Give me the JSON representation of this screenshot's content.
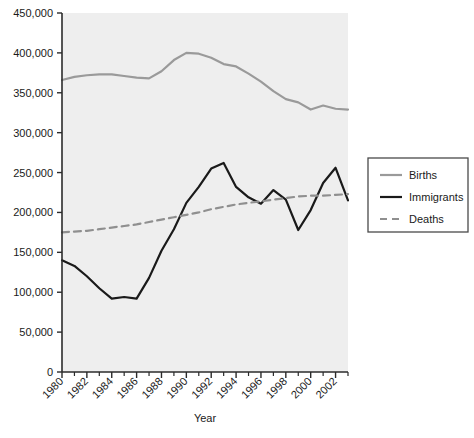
{
  "chart_data": {
    "type": "line",
    "title": "",
    "xlabel": "Year",
    "ylabel": "",
    "xlim": [
      1980,
      2003
    ],
    "ylim": [
      0,
      450000
    ],
    "grid": false,
    "legend_position": "right",
    "plot_background": "#eeeeee",
    "x": [
      1980,
      1981,
      1982,
      1983,
      1984,
      1985,
      1986,
      1987,
      1988,
      1989,
      1990,
      1991,
      1992,
      1993,
      1994,
      1995,
      1996,
      1997,
      1998,
      1999,
      2000,
      2001,
      2002,
      2003
    ],
    "xticks": [
      1980,
      1982,
      1984,
      1986,
      1988,
      1990,
      1992,
      1994,
      1996,
      1998,
      2000,
      2002
    ],
    "xtick_labels": [
      "1980",
      "1982",
      "1984",
      "1986",
      "1988",
      "1990",
      "1992",
      "1994",
      "1996",
      "1998",
      "2000",
      "2002"
    ],
    "xminorticks": [
      1981,
      1983,
      1985,
      1987,
      1989,
      1991,
      1993,
      1995,
      1997,
      1999,
      2001,
      2003
    ],
    "yticks": [
      0,
      50000,
      100000,
      150000,
      200000,
      250000,
      300000,
      350000,
      400000,
      450000
    ],
    "ytick_labels": [
      "0",
      "50,000",
      "100,000",
      "150,000",
      "200,000",
      "250,000",
      "300,000",
      "350,000",
      "400,000",
      "450,000"
    ],
    "series": [
      {
        "name": "Births",
        "color": "#9a9a9a",
        "style": "solid",
        "width": 2.2,
        "values": [
          366000,
          370000,
          372000,
          373000,
          373000,
          371000,
          369000,
          368000,
          377000,
          391000,
          400000,
          399000,
          394000,
          386000,
          383000,
          374000,
          364000,
          352000,
          342000,
          338000,
          329000,
          334000,
          330000,
          329000
        ]
      },
      {
        "name": "Immigrants",
        "color": "#1a1a1a",
        "style": "solid",
        "width": 2.2,
        "values": [
          140000,
          133000,
          120000,
          105000,
          92000,
          94000,
          92000,
          118000,
          152000,
          179000,
          212000,
          232000,
          255000,
          262000,
          232000,
          219000,
          211000,
          228000,
          216000,
          178000,
          203000,
          237000,
          256000,
          215000
        ]
      },
      {
        "name": "Deaths",
        "color": "#8f8f8f",
        "style": "dashed",
        "width": 2.2,
        "values": [
          175000,
          176000,
          177000,
          179000,
          181000,
          183000,
          185000,
          188000,
          191000,
          194000,
          197000,
          200000,
          204000,
          207000,
          210000,
          212000,
          214000,
          216000,
          218000,
          220000,
          221000,
          221000,
          222000,
          223000
        ]
      }
    ]
  },
  "legend": {
    "items": [
      {
        "label": "Births"
      },
      {
        "label": "Immigrants"
      },
      {
        "label": "Deaths"
      }
    ]
  },
  "axes": {
    "x_title": "Year"
  }
}
